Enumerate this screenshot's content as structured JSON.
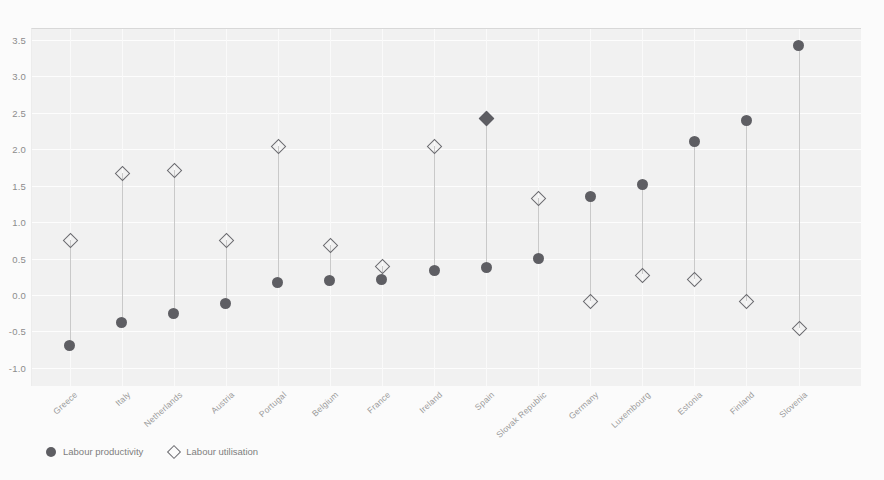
{
  "chart_data": {
    "type": "scatter",
    "title": "",
    "subtitle": "",
    "xlabel": "",
    "ylabel": "",
    "ylim": [
      -1.25,
      3.65
    ],
    "yticks": [
      "3.5",
      "3.0",
      "2.5",
      "2.0",
      "1.5",
      "1.0",
      "0.5",
      "0.0",
      "-0.5",
      "-1.0"
    ],
    "ytick_values": [
      3.5,
      3.0,
      2.5,
      2.0,
      1.5,
      1.0,
      0.5,
      0.0,
      -0.5,
      -1.0
    ],
    "grid": true,
    "legend_position": "bottom-left",
    "categories": [
      "Greece",
      "Italy",
      "Netherlands",
      "Austria",
      "Portugal",
      "Belgium",
      "France",
      "Ireland",
      "Spain",
      "Slovak Republic",
      "Germany",
      "Luxembourg",
      "Estonia",
      "Finland",
      "Slovenia"
    ],
    "series": [
      {
        "name": "Labour productivity",
        "marker": "filled-circle",
        "color": "#5e5e63",
        "values": [
          -0.7,
          -0.38,
          -0.25,
          -0.12,
          0.17,
          0.2,
          0.21,
          0.33,
          0.38,
          0.5,
          1.35,
          1.52,
          2.1,
          2.4,
          3.43
        ]
      },
      {
        "name": "Labour utilisation",
        "marker": "open-diamond",
        "color": "#6b6b70",
        "values": [
          0.75,
          1.68,
          1.72,
          0.75,
          2.05,
          0.68,
          0.4,
          2.05,
          2.43,
          1.33,
          -0.08,
          0.28,
          0.22,
          -0.08,
          -0.45
        ]
      }
    ],
    "highlighted_points": [
      {
        "category": "Spain",
        "series": "Labour utilisation",
        "style": "filled"
      }
    ]
  },
  "legend": {
    "items": [
      {
        "label": "Labour productivity",
        "icon": "filled-circle"
      },
      {
        "label": "Labour utilisation",
        "icon": "open-diamond"
      }
    ]
  },
  "colors": {
    "background": "#fbfbfb",
    "plot_background": "#f1f1f1",
    "gridline": "#fdfdfd",
    "stem": "#c9c9c9",
    "marker": "#5e5e63",
    "axis_text": "#8c8c8c",
    "category_text": "#9a9a9a"
  }
}
